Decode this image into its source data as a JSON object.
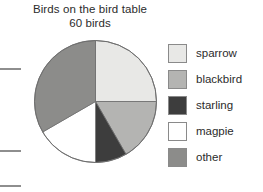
{
  "chart_data": {
    "type": "pie",
    "title": "Birds on the bird table",
    "subtitle": "60 birds",
    "total": 60,
    "total_unit": "birds",
    "xlabel": "",
    "ylabel": "",
    "grid": false,
    "legend_position": "right",
    "start_angle": 0,
    "direction": "clockwise",
    "categories": [
      "sparrow",
      "blackbird",
      "starling",
      "magpie",
      "other"
    ],
    "values": [
      15,
      10,
      5,
      10,
      20
    ],
    "percentages": [
      25,
      16.7,
      8.3,
      16.7,
      33.3
    ],
    "angles_deg": [
      90,
      60,
      30,
      60,
      120
    ],
    "slices": [
      {
        "label": "sparrow",
        "value": 15,
        "percent": 25.0,
        "angle_deg": 90,
        "start_deg": 0,
        "end_deg": 90,
        "color": "#e8e8e6"
      },
      {
        "label": "blackbird",
        "value": 10,
        "percent": 16.7,
        "angle_deg": 60,
        "start_deg": 90,
        "end_deg": 150,
        "color": "#b4b4b2"
      },
      {
        "label": "starling",
        "value": 5,
        "percent": 8.3,
        "angle_deg": 30,
        "start_deg": 150,
        "end_deg": 180,
        "color": "#3d3d3d"
      },
      {
        "label": "magpie",
        "value": 10,
        "percent": 16.7,
        "angle_deg": 60,
        "start_deg": 180,
        "end_deg": 240,
        "color": "#ffffff"
      },
      {
        "label": "other",
        "value": 20,
        "percent": 33.3,
        "angle_deg": 120,
        "start_deg": 240,
        "end_deg": 360,
        "color": "#8c8c8a"
      }
    ],
    "colors": {
      "sparrow": "#e8e8e6",
      "blackbird": "#b4b4b2",
      "starling": "#3d3d3d",
      "magpie": "#ffffff",
      "other": "#8c8c8a",
      "outline": "#6f6f6f",
      "text": "#2b2b2b",
      "background": "#ffffff"
    }
  },
  "legend": {
    "items": [
      {
        "label": "sparrow",
        "color": "#e8e8e6"
      },
      {
        "label": "blackbird",
        "color": "#b4b4b2"
      },
      {
        "label": "starling",
        "color": "#3d3d3d"
      },
      {
        "label": "magpie",
        "color": "#ffffff"
      },
      {
        "label": "other",
        "color": "#8c8c8a"
      }
    ]
  }
}
